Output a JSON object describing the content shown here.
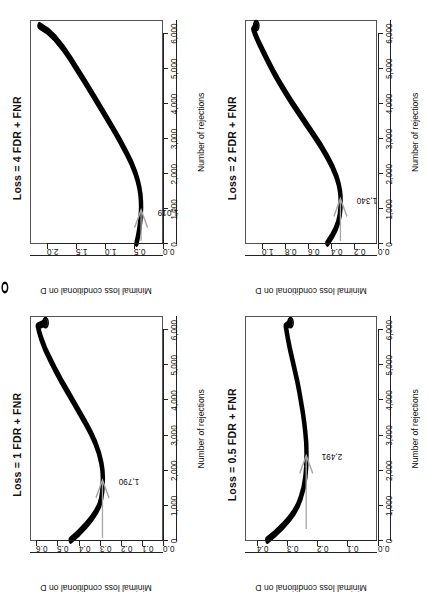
{
  "figure": {
    "orientation": "rotated-90-ccw",
    "background": "#ffffff",
    "curve_color": "#000000",
    "annotation_color": "#999999",
    "panel_count": 4
  },
  "chart_data": [
    {
      "type": "line",
      "panel_id": "panel-loss-1",
      "title": "Loss = 1 FDR + FNR",
      "xlabel": "Number of rejections",
      "ylabel": "Minimal loss conditional on D",
      "xlim": [
        0,
        6400
      ],
      "ylim": [
        0.0,
        0.63
      ],
      "xticks": [
        0,
        1000,
        2000,
        3000,
        4000,
        5000,
        6000
      ],
      "xticklabels": [
        "0",
        "1,000",
        "2,000",
        "3,000",
        "4,000",
        "5,000",
        "6,000"
      ],
      "yticks": [
        0.0,
        0.1,
        0.2,
        0.3,
        0.4,
        0.5,
        0.6
      ],
      "yticklabels": [
        "0.0",
        "0.1",
        "0.2",
        "0.3",
        "0.4",
        "0.5",
        "0.6"
      ],
      "grid": false,
      "legend": "none",
      "annotation": {
        "label": "1,790",
        "x": 1790,
        "y": 0.285,
        "marker": "arrow"
      },
      "endpoint_marker": "open-circle",
      "x": [
        0,
        200,
        400,
        600,
        800,
        1000,
        1200,
        1400,
        1600,
        1790,
        2000,
        2200,
        2500,
        2800,
        3100,
        3400,
        3700,
        4000,
        4300,
        4600,
        4900,
        5200,
        5500,
        5800,
        6000,
        6150,
        6250
      ],
      "values": [
        0.438,
        0.4,
        0.368,
        0.34,
        0.317,
        0.3,
        0.291,
        0.286,
        0.284,
        0.283,
        0.285,
        0.29,
        0.302,
        0.32,
        0.343,
        0.37,
        0.399,
        0.428,
        0.457,
        0.486,
        0.513,
        0.538,
        0.562,
        0.581,
        0.591,
        0.597,
        0.56
      ]
    },
    {
      "type": "line",
      "panel_id": "panel-loss-4",
      "title": "Loss = 4 FDR + FNR",
      "xlabel": "Number of rejections",
      "ylabel": "Minimal loss conditional on D",
      "xlim": [
        0,
        6400
      ],
      "ylim": [
        0.0,
        2.3
      ],
      "xticks": [
        0,
        1000,
        2000,
        3000,
        4000,
        5000,
        6000
      ],
      "xticklabels": [
        "0",
        "1,000",
        "2,000",
        "3,000",
        "4,000",
        "5,000",
        "6,000"
      ],
      "yticks": [
        0.0,
        0.5,
        1.0,
        1.5,
        2.0
      ],
      "yticklabels": [
        "0.0",
        "0.5",
        "1.0",
        "1.5",
        "2.0"
      ],
      "grid": false,
      "legend": "none",
      "annotation": {
        "label": "1,019",
        "x": 1019,
        "y": 0.36,
        "marker": "arrow"
      },
      "endpoint_marker": "none",
      "x": [
        0,
        200,
        400,
        600,
        800,
        1019,
        1200,
        1400,
        1600,
        1800,
        2000,
        2300,
        2600,
        2900,
        3200,
        3500,
        3800,
        4100,
        4400,
        4700,
        5000,
        5300,
        5600,
        5900,
        6100,
        6250
      ],
      "values": [
        0.44,
        0.413,
        0.392,
        0.376,
        0.366,
        0.36,
        0.362,
        0.372,
        0.392,
        0.42,
        0.458,
        0.53,
        0.62,
        0.718,
        0.822,
        0.93,
        1.04,
        1.15,
        1.262,
        1.375,
        1.49,
        1.605,
        1.73,
        1.88,
        2.01,
        2.15
      ]
    },
    {
      "type": "line",
      "panel_id": "panel-loss-0-5",
      "title": "Loss = 0.5 FDR + FNR",
      "xlabel": "Number of rejections",
      "ylabel": "Minimal loss conditional on D",
      "xlim": [
        0,
        6400
      ],
      "ylim": [
        0.0,
        0.44
      ],
      "xticks": [
        0,
        1000,
        2000,
        3000,
        4000,
        5000,
        6000
      ],
      "xticklabels": [
        "0",
        "1,000",
        "2,000",
        "3,000",
        "4,000",
        "5,000",
        "6,000"
      ],
      "yticks": [
        0.0,
        0.1,
        0.2,
        0.3,
        0.4
      ],
      "yticklabels": [
        "0.0",
        "0.1",
        "0.2",
        "0.3",
        "0.4"
      ],
      "grid": false,
      "legend": "none",
      "annotation": {
        "label": "2,491",
        "x": 2491,
        "y": 0.237,
        "marker": "arrow"
      },
      "endpoint_marker": "open-circle",
      "x": [
        0,
        200,
        400,
        600,
        800,
        1000,
        1200,
        1500,
        1800,
        2100,
        2491,
        2800,
        3100,
        3400,
        3700,
        4000,
        4300,
        4600,
        4900,
        5200,
        5500,
        5800,
        6000,
        6150,
        6250
      ],
      "values": [
        0.368,
        0.34,
        0.316,
        0.295,
        0.278,
        0.265,
        0.256,
        0.246,
        0.24,
        0.237,
        0.236,
        0.237,
        0.24,
        0.244,
        0.249,
        0.255,
        0.261,
        0.268,
        0.276,
        0.284,
        0.292,
        0.299,
        0.303,
        0.306,
        0.29
      ]
    },
    {
      "type": "line",
      "panel_id": "panel-loss-2",
      "title": "Loss = 2 FDR + FNR",
      "xlabel": "Number of rejections",
      "ylabel": "Minimal loss conditional on D",
      "xlim": [
        0,
        6400
      ],
      "ylim": [
        0.0,
        1.15
      ],
      "xticks": [
        0,
        1000,
        2000,
        3000,
        4000,
        5000,
        6000
      ],
      "xticklabels": [
        "0",
        "1,000",
        "2,000",
        "3,000",
        "4,000",
        "5,000",
        "6,000"
      ],
      "yticks": [
        0.0,
        0.2,
        0.4,
        0.6,
        0.8,
        1.0
      ],
      "yticklabels": [
        "0.0",
        "0.2",
        "0.4",
        "0.6",
        "0.8",
        "1.0"
      ],
      "grid": false,
      "legend": "none",
      "annotation": {
        "label": "1,340",
        "x": 1340,
        "y": 0.318,
        "marker": "arrow"
      },
      "endpoint_marker": "open-circle",
      "x": [
        0,
        200,
        400,
        600,
        800,
        1000,
        1200,
        1340,
        1500,
        1700,
        1900,
        2200,
        2500,
        2800,
        3100,
        3400,
        3700,
        4000,
        4300,
        4600,
        4900,
        5200,
        5500,
        5800,
        6000,
        6150,
        6250
      ],
      "values": [
        0.432,
        0.392,
        0.36,
        0.338,
        0.324,
        0.318,
        0.316,
        0.317,
        0.322,
        0.334,
        0.352,
        0.39,
        0.438,
        0.492,
        0.552,
        0.614,
        0.676,
        0.738,
        0.796,
        0.852,
        0.904,
        0.952,
        0.998,
        1.042,
        1.068,
        1.085,
        1.06
      ]
    }
  ]
}
